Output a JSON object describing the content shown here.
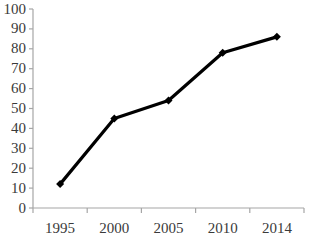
{
  "chart_data": {
    "type": "line",
    "title": "",
    "xlabel": "",
    "ylabel": "",
    "categories": [
      "1995",
      "2000",
      "2005",
      "2010",
      "2014"
    ],
    "values": [
      12,
      45,
      54,
      78,
      86
    ],
    "series": [
      {
        "name": "series-1",
        "values": [
          12,
          45,
          54,
          78,
          86
        ]
      }
    ],
    "ylim": [
      0,
      100
    ],
    "ytick_step": 10,
    "ytick_labels": [
      "100",
      "90",
      "80",
      "70",
      "60",
      "50",
      "40",
      "30",
      "20",
      "10",
      "0"
    ],
    "ytick_values": [
      100,
      90,
      80,
      70,
      60,
      50,
      40,
      30,
      20,
      10,
      0
    ],
    "grid": false,
    "legend": false,
    "legend_position": "none",
    "marker": "diamond",
    "colors": {
      "line": "#000000",
      "marker": "#000000",
      "axis": "#a6a6a6",
      "tick_label": "#3a3a3a",
      "background": "#ffffff"
    }
  }
}
